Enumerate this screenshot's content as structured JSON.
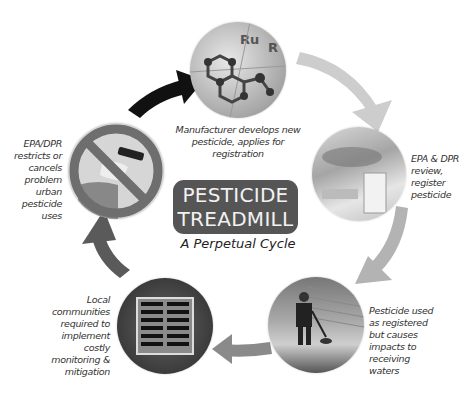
{
  "title": {
    "line1": "PESTICIDE",
    "line2": "TREADMILL",
    "subtitle": "A Perpetual Cycle"
  },
  "stages": [
    {
      "id": "develop",
      "photo": "molecule-model-photo",
      "caption_lines": [
        "Manufacturer develops new",
        "pesticide, applies for",
        "registration"
      ]
    },
    {
      "id": "register",
      "photo": "lab-review-photo",
      "caption_lines": [
        "EPA & DPR",
        "review,",
        "register",
        "pesticide"
      ]
    },
    {
      "id": "use",
      "photo": "spraying-applicator-photo",
      "caption_lines": [
        "Pesticide used",
        "as registered",
        "but causes",
        "impacts to",
        "receiving",
        "waters"
      ]
    },
    {
      "id": "mitigate",
      "photo": "storm-drain-photo",
      "caption_lines": [
        "Local",
        "communities",
        "required to",
        "implement",
        "costly",
        "monitoring &",
        "mitigation"
      ]
    },
    {
      "id": "restrict",
      "photo": "prohibited-sprayer-photo",
      "caption_lines": [
        "EPA/DPR",
        "restricts or",
        "cancels",
        "problem",
        "urban",
        "pesticide",
        "uses"
      ]
    }
  ],
  "colors": {
    "center_box": "#555555",
    "arrow_light": "#c8c8c8",
    "arrow_mid_light": "#b5b5b5",
    "arrow_mid": "#8a8a8a",
    "arrow_dark": "#5a5a5a",
    "arrow_black": "#111111",
    "prohibit_ring": "#6e6e6e"
  }
}
